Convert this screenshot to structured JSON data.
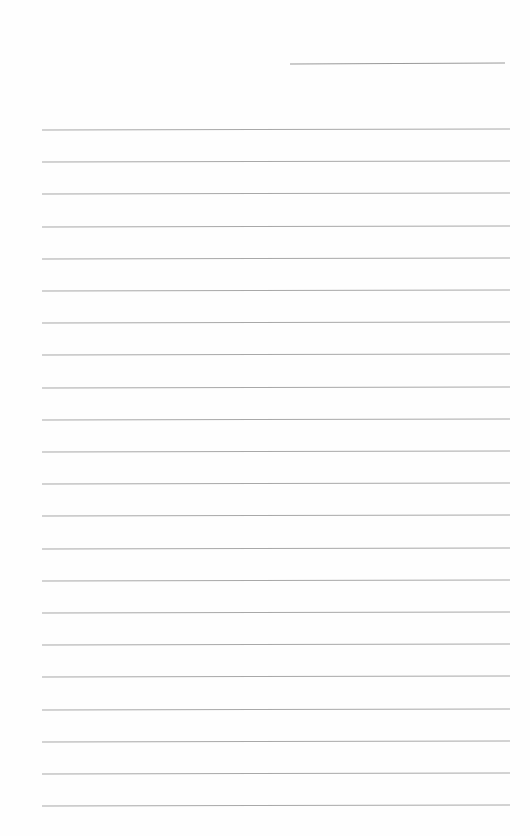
{
  "document": {
    "type": "lined-paper",
    "background_color": "#ffffff",
    "line_color": "#a8a8a8",
    "header_line": {
      "left": 290,
      "top": 63,
      "width": 215
    },
    "ruled_lines": {
      "count": 22,
      "first_top": 129,
      "spacing": 32.2,
      "left": 42,
      "width": 468
    }
  }
}
